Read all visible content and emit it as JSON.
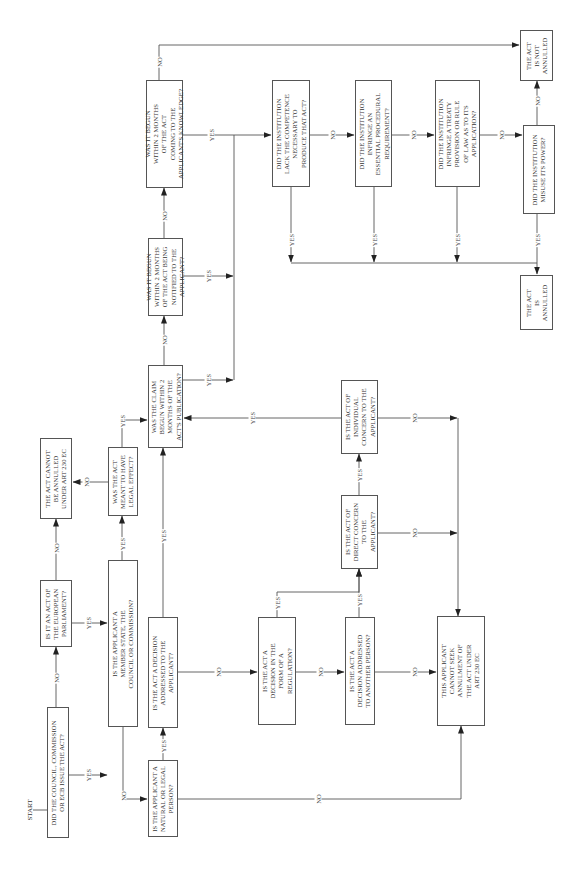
{
  "diagram": {
    "orientation": "rotated 90° counter-clockwise",
    "start_label": "START",
    "nodes": {
      "q_issuer": "DID THE COUNCIL, COMMISSION\nOR ECB ISSUE THE ACT?",
      "q_ep": "IS IT AN ACT OF\nTHE EUROPEAN\nPARLIAMENT?",
      "end_cannot_be_annulled": "THE ACT CANNOT\nBE ANNULLED\nUNDER ART 230 EC",
      "q_privileged": "IS THE APPLICANT A\nMEMBER STATE, THE\nCOUNCIL OR COMMISSION?",
      "q_legal_effect": "WAS THE ACT\nMEANT TO HAVE\nLEGAL EFFECT?",
      "q_publication": "WAS THE CLAIM\nBEGUN WITHIN 2\nMONTHS OF THE\nACT'S PUBLICATION?",
      "q_notified": "WAS IT BEGUN\nWITHIN 2 MONTHS\nOF THE ACT BEING\nNOTIFIED TO THE\nAPPLICANT?",
      "q_knowledge": "WAS IT BEGUN\nWITHIN 2 MONTHS\nOF THE ACT\nCOMING TO THE\nAPPLICANT'S KNOWLEDGE?",
      "q_natural_legal": "IS THE APPLICANT A\nNATURAL OR LEGAL\nPERSON?",
      "q_decision_applicant": "IS THE ACT A DECISION\nADDRESSED TO THE\nAPPLICANT?",
      "q_form_regulation": "IS THE ACT A\nDECISION IN THE\nFORM OF A\nREGULATION?",
      "q_another_person": "IS THE ACT A\nDECISION ADDRESSED\nTO ANOTHER PERSON?",
      "q_direct_concern": "IS THE ACT OF\nDIRECT CONCERN\nTO THE\nAPPLICANT?",
      "q_individual_concern": "IS THE ACT OF\nINDIVIDUAL\nCONCERN TO THE\nAPPLICANT?",
      "end_cannot_seek": "THIS APPLICANT\nCANNOT SEEK\nANNULMENT OF\nTHE ACT UNDER\nART 230 EC",
      "q_competence": "DID THE INSTITUTION\nLACK THE COMPETENCE\nNECESSARY TO\nPRODUCE THAT ACT?",
      "q_procedural": "DID THE INSTITUTION\nINFRINGE AN\nESSENTIAL PROCEDURAL\nREQUIREMENT?",
      "q_treaty": "DID THE INSTITUTION\nINFRINGE A TREATY\nPROVISION OR RULE\nOF LAW AS TO ITS\nAPPLICATION?",
      "q_misuse": "DID THE INSTITUTION\nMISUSE ITS POWER?",
      "end_not_annulled": "THE ACT\nIS NOT\nANNULLED",
      "end_annulled": "THE ACT\nIS\nANNULLED"
    },
    "edge_labels": {
      "yes": "YES",
      "no": "NO"
    }
  }
}
